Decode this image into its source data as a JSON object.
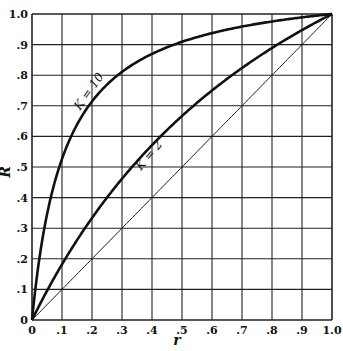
{
  "chart_data": {
    "type": "line",
    "title": "",
    "xlabel": "r",
    "ylabel": "R",
    "xlim": [
      0,
      1.0
    ],
    "ylim": [
      0,
      1.0
    ],
    "grid": true,
    "x_ticks": [
      "0",
      ".1",
      ".2",
      ".3",
      ".4",
      ".5",
      ".6",
      ".7",
      ".8",
      ".9",
      "1.0"
    ],
    "y_ticks": [
      "0",
      ".1",
      ".2",
      ".3",
      ".4",
      ".5",
      ".6",
      ".7",
      ".8",
      ".9",
      "1.0"
    ],
    "formula": "R = K r / (1 + (K - 1) r)",
    "x": [
      0,
      0.1,
      0.2,
      0.3,
      0.4,
      0.5,
      0.6,
      0.7,
      0.8,
      0.9,
      1.0
    ],
    "series": [
      {
        "name": "K = 10",
        "K": 10,
        "style": "thick",
        "values": [
          0,
          0.526,
          0.714,
          0.811,
          0.87,
          0.909,
          0.938,
          0.959,
          0.976,
          0.989,
          1.0
        ],
        "label_pos": {
          "r": 0.2,
          "R": 0.74
        }
      },
      {
        "name": "K = 2",
        "K": 2,
        "style": "thick",
        "values": [
          0,
          0.182,
          0.333,
          0.462,
          0.571,
          0.667,
          0.75,
          0.824,
          0.889,
          0.947,
          1.0
        ],
        "label_pos": {
          "r": 0.4,
          "R": 0.53
        }
      },
      {
        "name": "K = 1 (diagonal)",
        "K": 1,
        "style": "thin",
        "values": [
          0,
          0.1,
          0.2,
          0.3,
          0.4,
          0.5,
          0.6,
          0.7,
          0.8,
          0.9,
          1.0
        ]
      }
    ]
  }
}
